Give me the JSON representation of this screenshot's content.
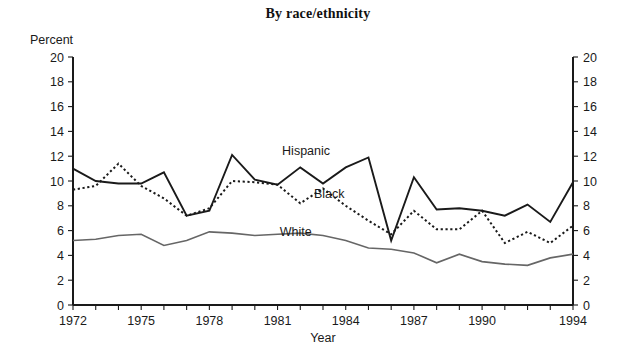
{
  "chart_data": {
    "type": "line",
    "title": "By race/ethnicity",
    "xlabel": "Year",
    "ylabel": "Percent",
    "ylim": [
      0,
      20
    ],
    "xlim": [
      1972,
      1994
    ],
    "ytick_step": 2,
    "ytick_labels": [
      "0",
      "2",
      "4",
      "6",
      "8",
      "10",
      "12",
      "14",
      "16",
      "18",
      "20"
    ],
    "xtick_labels": [
      "1972",
      "1975",
      "1978",
      "1981",
      "1984",
      "1987",
      "1990",
      "1994"
    ],
    "xtick_labeled_years": [
      1972,
      1975,
      1978,
      1981,
      1984,
      1987,
      1990,
      1994
    ],
    "grid": false,
    "legend_position": "inline-annotations",
    "dual_y_axis": true,
    "x": [
      1972,
      1973,
      1974,
      1975,
      1976,
      1977,
      1978,
      1979,
      1980,
      1981,
      1982,
      1983,
      1984,
      1985,
      1986,
      1987,
      1988,
      1989,
      1990,
      1991,
      1992,
      1993,
      1994
    ],
    "series": [
      {
        "name": "Hispanic",
        "style": "solid",
        "color": "#1a1a1a",
        "width": 1.9,
        "label_x": 1981.2,
        "label_y": 12.1,
        "values": [
          11.0,
          10.0,
          9.8,
          9.8,
          10.7,
          7.2,
          7.6,
          12.1,
          10.1,
          9.7,
          11.1,
          9.8,
          11.1,
          11.9,
          5.2,
          10.3,
          7.7,
          7.8,
          7.6,
          7.2,
          8.1,
          6.7,
          9.9
        ]
      },
      {
        "name": "Black",
        "style": "dotted",
        "color": "#1a1a1a",
        "width": 2.0,
        "label_x": 1982.6,
        "label_y": 8.6,
        "values": [
          9.3,
          9.6,
          11.4,
          9.6,
          8.6,
          7.2,
          7.8,
          10.0,
          9.9,
          9.7,
          8.2,
          9.4,
          8.0,
          6.8,
          5.7,
          7.6,
          6.1,
          6.1,
          7.6,
          5.0,
          5.9,
          5.0,
          6.4
        ]
      },
      {
        "name": "White",
        "style": "solid",
        "color": "#666666",
        "width": 1.6,
        "label_x": 1981.1,
        "label_y": 5.6,
        "values": [
          5.2,
          5.3,
          5.6,
          5.7,
          4.8,
          5.2,
          5.9,
          5.8,
          5.6,
          5.7,
          5.8,
          5.6,
          5.2,
          4.6,
          4.5,
          4.2,
          3.4,
          4.1,
          3.5,
          3.3,
          3.2,
          3.8,
          4.1
        ]
      }
    ]
  },
  "extra": {
    "percent_axis_label": "Percent",
    "year_axis_label": "Year"
  }
}
